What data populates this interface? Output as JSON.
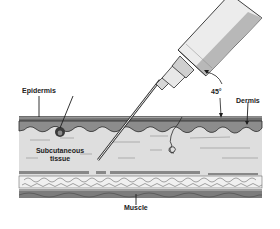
{
  "diagram": {
    "angle_label": "45°",
    "labels": {
      "epidermis": "Epidermis",
      "dermis": "Dermis",
      "subcutaneous_line1": "Subcutaneous",
      "subcutaneous_line2": "tissue",
      "muscle": "Muscle"
    },
    "colors": {
      "epidermis": "#6f6f6f",
      "dermis": "#8a8a8a",
      "subcutaneous": "#dcdcdc",
      "fat": "#efefef",
      "muscle": "#7a7a7a",
      "syringe_barrel": "#e6e6e6",
      "syringe_shade": "#b5b5b5",
      "line": "#1e1e1e"
    }
  }
}
